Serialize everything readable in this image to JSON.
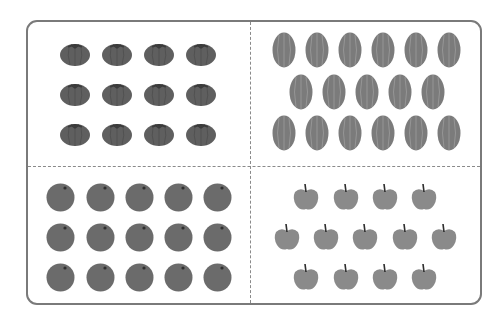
{
  "title": "",
  "colors": {
    "frame_border": "#7a7a7a",
    "divider": "#8a8a8a",
    "tomato": "#5f5f5f",
    "watermelon": "#7b7b7b",
    "orange": "#6b6b6b",
    "apple": "#8a8a8a"
  },
  "quadrants": [
    {
      "name": "tomatoes",
      "count": 12,
      "rows": [
        4,
        4,
        4
      ],
      "positions": [
        [
          75,
          53
        ],
        [
          117,
          53
        ],
        [
          159,
          53
        ],
        [
          201,
          53
        ],
        [
          75,
          93
        ],
        [
          117,
          93
        ],
        [
          159,
          93
        ],
        [
          201,
          93
        ],
        [
          75,
          133
        ],
        [
          117,
          133
        ],
        [
          159,
          133
        ],
        [
          201,
          133
        ]
      ]
    },
    {
      "name": "watermelons",
      "count": 17,
      "rows": [
        6,
        5,
        6
      ],
      "positions": [
        [
          284,
          50
        ],
        [
          317,
          50
        ],
        [
          350,
          50
        ],
        [
          383,
          50
        ],
        [
          416,
          50
        ],
        [
          449,
          50
        ],
        [
          301,
          92
        ],
        [
          334,
          92
        ],
        [
          367,
          92
        ],
        [
          400,
          92
        ],
        [
          433,
          92
        ],
        [
          284,
          133
        ],
        [
          317,
          133
        ],
        [
          350,
          133
        ],
        [
          383,
          133
        ],
        [
          416,
          133
        ],
        [
          449,
          133
        ]
      ]
    },
    {
      "name": "oranges",
      "count": 15,
      "rows": [
        5,
        5,
        5
      ],
      "positions": [
        [
          60,
          197
        ],
        [
          100,
          197
        ],
        [
          139,
          197
        ],
        [
          178,
          197
        ],
        [
          217,
          197
        ],
        [
          60,
          237
        ],
        [
          100,
          237
        ],
        [
          139,
          237
        ],
        [
          178,
          237
        ],
        [
          217,
          237
        ],
        [
          60,
          277
        ],
        [
          100,
          277
        ],
        [
          139,
          277
        ],
        [
          178,
          277
        ],
        [
          217,
          277
        ]
      ]
    },
    {
      "name": "apples",
      "count": 13,
      "rows": [
        4,
        5,
        4
      ],
      "positions": [
        [
          306,
          197
        ],
        [
          346,
          197
        ],
        [
          385,
          197
        ],
        [
          424,
          197
        ],
        [
          287,
          237
        ],
        [
          326,
          237
        ],
        [
          365,
          237
        ],
        [
          405,
          237
        ],
        [
          444,
          237
        ],
        [
          306,
          277
        ],
        [
          346,
          277
        ],
        [
          385,
          277
        ],
        [
          424,
          277
        ]
      ]
    }
  ]
}
